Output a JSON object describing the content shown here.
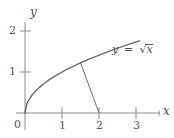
{
  "chart_data": {
    "type": "line",
    "title": "",
    "xlabel": "x",
    "ylabel": "y",
    "xlim": [
      -0.25,
      3.4
    ],
    "ylim": [
      -0.2,
      2.25
    ],
    "grid": false,
    "legend": "none",
    "function": "y = sqrt(x)",
    "x_ticks": [
      1,
      2,
      3
    ],
    "x_tick_labels": [
      "1",
      "2",
      "3"
    ],
    "y_ticks": [
      1,
      2
    ],
    "y_tick_labels": [
      "1",
      "2"
    ],
    "origin_label": "0",
    "series": [
      {
        "name": "y = sqrt(x)",
        "x": [
          0,
          0.05,
          0.1,
          0.2,
          0.3,
          0.4,
          0.5,
          0.7,
          0.9,
          1.1,
          1.3,
          1.5,
          1.7,
          2.0,
          2.3,
          2.6,
          2.9,
          3.1
        ],
        "y": [
          0,
          0.224,
          0.316,
          0.447,
          0.548,
          0.632,
          0.707,
          0.837,
          0.949,
          1.049,
          1.14,
          1.225,
          1.304,
          1.414,
          1.517,
          1.612,
          1.703,
          1.761
        ]
      }
    ],
    "annotations": [
      {
        "name": "normal-segment",
        "type": "line-segment",
        "from": [
          1.5,
          1.225
        ],
        "to": [
          2.0,
          0.0
        ]
      }
    ],
    "curve_label": {
      "text": "y = √x",
      "lhs": "y",
      "equals": "=",
      "radicand": "x",
      "x": 2.45,
      "y": 1.5
    }
  },
  "axes": {
    "x_axis_name": "x",
    "y_axis_name": "y"
  },
  "colors": {
    "curve": "#6b6b6b",
    "axis": "#8a8a8a",
    "segment": "#6b6b6b",
    "text": "#4f4f4f",
    "background": "#ffffff"
  }
}
